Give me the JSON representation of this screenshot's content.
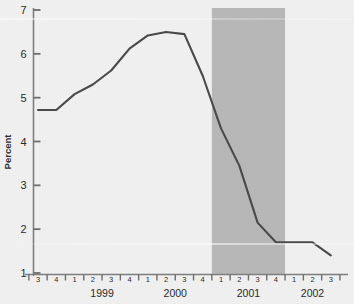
{
  "chart_data": {
    "type": "line",
    "title": "",
    "subtitle": "",
    "xlabel": "",
    "ylabel": "Percent",
    "ylim": [
      1,
      7
    ],
    "yticks": [
      1,
      2,
      3,
      4,
      5,
      6,
      7
    ],
    "ytick_labels": [
      "1",
      "2",
      "3",
      "4",
      "5",
      "6",
      "7"
    ],
    "grid": false,
    "legend": "none",
    "x": [
      "1998 Q3",
      "1998 Q4",
      "1999 Q1",
      "1999 Q2",
      "1999 Q3",
      "1999 Q4",
      "2000 Q1",
      "2000 Q2",
      "2000 Q3",
      "2000 Q4",
      "2001 Q1",
      "2001 Q2",
      "2001 Q3",
      "2001 Q4",
      "2002 Q1",
      "2002 Q2",
      "2002 Q3"
    ],
    "quarter_labels": [
      "3",
      "4",
      "1",
      "2",
      "3",
      "4",
      "1",
      "2",
      "3",
      "4",
      "1",
      "2",
      "3",
      "4",
      "1",
      "2",
      "3"
    ],
    "year_labels": [
      {
        "label": "1999",
        "center_index": 3.5
      },
      {
        "label": "2000",
        "center_index": 7.5
      },
      {
        "label": "2001",
        "center_index": 11.5
      },
      {
        "label": "2002",
        "center_index": 15.0
      }
    ],
    "series": [
      {
        "name": "Percent",
        "color": "#4a4a4a",
        "values": [
          4.72,
          4.72,
          5.08,
          5.3,
          5.62,
          6.12,
          6.42,
          6.5,
          6.45,
          5.5,
          4.3,
          3.45,
          2.15,
          1.7,
          1.7,
          1.7,
          1.4
        ]
      }
    ],
    "shaded_regions": [
      {
        "name": "recession-band",
        "label": "",
        "start_index": 9.5,
        "end_index": 13.5,
        "color": "#b8b8b8",
        "start_x": "2001 Q1",
        "end_x": "2001 Q4"
      }
    ],
    "axis_color": "#707070",
    "background_color": "#f1f1f1"
  }
}
